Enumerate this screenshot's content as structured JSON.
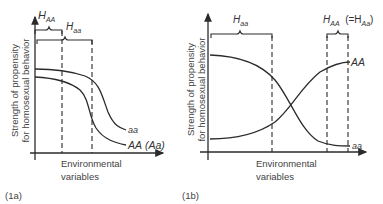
{
  "panels": [
    {
      "id": "1a",
      "label": "(1a)",
      "ylabel_line1": "Strength of propensity",
      "ylabel_line2": "for homosexual behavior",
      "xlabel_line1": "Environmental",
      "xlabel_line2": "variables",
      "braces": [
        {
          "main": "H",
          "sub": "AA"
        },
        {
          "main": "H",
          "sub": "aa"
        }
      ],
      "curves": [
        {
          "name": "aa",
          "label": "aa"
        },
        {
          "name": "AA",
          "label": "AA",
          "label_extra": "(Aa)"
        }
      ]
    },
    {
      "id": "1b",
      "label": "(1b)",
      "ylabel_line1": "Strength of propensity",
      "ylabel_line2": "for homosexual behavior",
      "xlabel_line1": "Environmental",
      "xlabel_line2": "variables",
      "braces": [
        {
          "main": "H",
          "sub": "aa"
        },
        {
          "main": "H",
          "sub": "AA",
          "note_prefix": "(=H",
          "note_sub": "Aa",
          "note_suffix": ")"
        }
      ],
      "curves": [
        {
          "name": "AA",
          "label": "AA"
        },
        {
          "name": "aa",
          "label": "aa"
        }
      ]
    }
  ],
  "colors": {
    "line": "#2b2b2b",
    "background": "#ffffff"
  }
}
